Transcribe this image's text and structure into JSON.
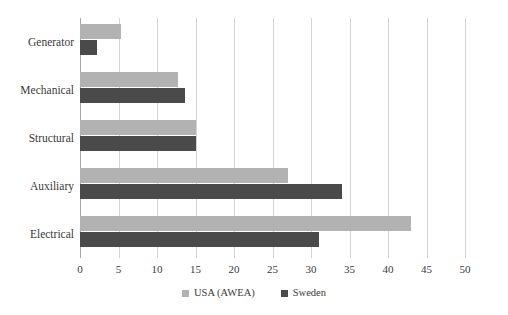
{
  "chart_data": {
    "type": "bar",
    "orientation": "horizontal",
    "title": "",
    "xlabel": "",
    "ylabel": "",
    "xlim": [
      0,
      50
    ],
    "xticks": [
      0,
      5,
      10,
      15,
      20,
      25,
      30,
      35,
      40,
      45,
      50
    ],
    "grid": true,
    "legend_position": "bottom",
    "categories": [
      "Generator",
      "Mechanical",
      "Structural",
      "Auxiliary",
      "Electrical"
    ],
    "series": [
      {
        "name": "USA (AWEA)",
        "color": "#b2b2b2",
        "values": [
          5.3,
          12.7,
          15.0,
          27.0,
          43.0
        ]
      },
      {
        "name": "Sweden",
        "color": "#4a4a4a",
        "values": [
          2.2,
          13.7,
          15.0,
          34.0,
          31.0
        ]
      }
    ]
  },
  "colors": {
    "series_usa": "#b2b2b2",
    "series_sweden": "#4a4a4a",
    "gridline": "#d4d4d4",
    "axis": "#a8a8a8",
    "text": "#3a3a3a",
    "background": "#ffffff"
  }
}
